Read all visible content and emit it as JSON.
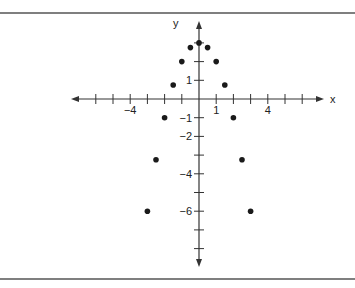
{
  "chart_data": {
    "type": "scatter",
    "title": "",
    "xlabel": "x",
    "ylabel": "y",
    "xlim": [
      -6,
      6
    ],
    "ylim": [
      -8,
      3
    ],
    "x_ticks": [
      -6,
      -5,
      -4,
      -3,
      -2,
      -1,
      0,
      1,
      2,
      3,
      4,
      5,
      6
    ],
    "y_ticks": [
      -8,
      -7,
      -6,
      -5,
      -4,
      -3,
      -2,
      -1,
      0,
      1,
      2,
      3
    ],
    "x_tick_labels": [
      {
        "value": -4,
        "label": "−4"
      },
      {
        "value": 1,
        "label": "1"
      },
      {
        "value": 4,
        "label": "4"
      }
    ],
    "y_tick_labels": [
      {
        "value": 1,
        "label": "1"
      },
      {
        "value": -1,
        "label": "−1"
      },
      {
        "value": -2,
        "label": "−2"
      },
      {
        "value": -4,
        "label": "−4"
      },
      {
        "value": -6,
        "label": "−6"
      }
    ],
    "grid": false,
    "series": [
      {
        "name": "points",
        "x": [
          -3,
          -2.5,
          -2,
          -1.5,
          -1,
          -0.5,
          0,
          0.5,
          1,
          1.5,
          2,
          2.5,
          3
        ],
        "y": [
          -6,
          -3.25,
          -1,
          0.75,
          2,
          2.75,
          3,
          2.75,
          2,
          0.75,
          -1,
          -3.25,
          -6
        ]
      }
    ]
  }
}
